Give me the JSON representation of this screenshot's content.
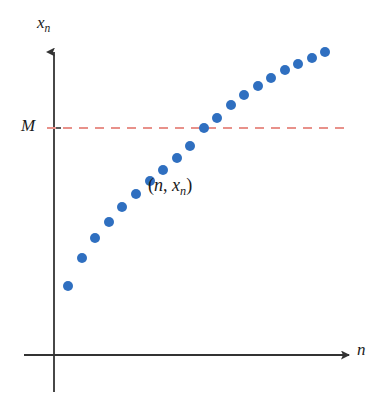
{
  "figure": {
    "background_color": "#ffffff",
    "axis_color": "#333333",
    "dot_color": "#2f6fc0",
    "threshold_line_color": "#e8918a"
  },
  "labels": {
    "y_axis_var": "x",
    "y_axis_sub": "n",
    "x_axis_var": "n",
    "threshold": "M",
    "annotation_open": "(",
    "annotation_first": "n",
    "annotation_comma": ", ",
    "annotation_second": "x",
    "annotation_second_sub": "n",
    "annotation_close": ")"
  },
  "chart_data": {
    "type": "scatter",
    "title": "",
    "xlabel": "n",
    "ylabel": "x_n",
    "grid": false,
    "legend": null,
    "annotations": [
      {
        "text": "(n, x_n)",
        "x_px": 148,
        "y_px": 176,
        "note": "label identifying a generic sequence point"
      },
      {
        "text": "M",
        "x_px": 21,
        "y_px": 117,
        "note": "upper bound marked on the vertical axis"
      }
    ],
    "reference_lines": [
      {
        "orientation": "horizontal",
        "label": "M",
        "y_px": 128,
        "x_start_px": 47,
        "x_end_px": 346,
        "style": "dashed",
        "color": "#e8918a"
      }
    ],
    "axes": {
      "origin_px": [
        54,
        355
      ],
      "y_axis_top_px": 50,
      "y_axis_bottom_px": 392,
      "x_axis_left_px": 24,
      "x_axis_right_px": 351,
      "arrowheads": [
        "y-top",
        "x-right"
      ],
      "tick_marks": [
        {
          "axis": "y",
          "label": "M",
          "y_px": 128
        }
      ]
    },
    "series": [
      {
        "name": "(n, x_n)",
        "marker": "circle",
        "marker_radius_px": 5,
        "color": "#2f6fc0",
        "points_px": [
          [
            68,
            286
          ],
          [
            82,
            258
          ],
          [
            95,
            238
          ],
          [
            109,
            222
          ],
          [
            122,
            207
          ],
          [
            136,
            194
          ],
          [
            150,
            181
          ],
          [
            163,
            170
          ],
          [
            177,
            158
          ],
          [
            190,
            146
          ],
          [
            204,
            128
          ],
          [
            217,
            118
          ],
          [
            231,
            105
          ],
          [
            244,
            95
          ],
          [
            258,
            86
          ],
          [
            271,
            78
          ],
          [
            285,
            70
          ],
          [
            298,
            64
          ],
          [
            312,
            58
          ],
          [
            325,
            52
          ]
        ],
        "description": "Increasing sequence of points approaching and crossing the level M"
      }
    ]
  }
}
